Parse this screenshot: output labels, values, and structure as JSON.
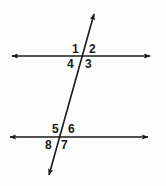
{
  "figure": {
    "name": "parallel-lines-cut-by-transversal",
    "background_color": "#fefefe",
    "stroke_color": "#1a1a1a",
    "label_color": "#1a1a1a",
    "width": 166,
    "height": 186
  },
  "lines": {
    "top_parallel": {
      "name": "top-parallel-line",
      "x1": 12,
      "y1": 56,
      "x2": 150,
      "y2": 56,
      "arrows": "both"
    },
    "bottom_parallel": {
      "name": "bottom-parallel-line",
      "x1": 10,
      "y1": 137,
      "x2": 148,
      "y2": 137,
      "arrows": "both"
    },
    "transversal": {
      "name": "transversal-line",
      "x1": 94,
      "y1": 14,
      "x2": 49,
      "y2": 175,
      "arrows": "both"
    }
  },
  "intersections": {
    "top": {
      "x": 82,
      "y": 56
    },
    "bottom": {
      "x": 59,
      "y": 137
    }
  },
  "angle_labels": [
    {
      "id": "angle-1",
      "text": "1",
      "x": 72,
      "y": 43,
      "position": "top-intersection-upper-left"
    },
    {
      "id": "angle-2",
      "text": "2",
      "x": 89,
      "y": 43,
      "position": "top-intersection-upper-right"
    },
    {
      "id": "angle-3",
      "text": "3",
      "x": 85,
      "y": 58,
      "position": "top-intersection-lower-right"
    },
    {
      "id": "angle-4",
      "text": "4",
      "x": 67,
      "y": 58,
      "position": "top-intersection-lower-left"
    },
    {
      "id": "angle-5",
      "text": "5",
      "x": 52,
      "y": 123,
      "position": "bottom-intersection-upper-left"
    },
    {
      "id": "angle-6",
      "text": "6",
      "x": 68,
      "y": 123,
      "position": "bottom-intersection-upper-right"
    },
    {
      "id": "angle-7",
      "text": "7",
      "x": 61,
      "y": 139,
      "position": "bottom-intersection-lower-right"
    },
    {
      "id": "angle-8",
      "text": "8",
      "x": 45,
      "y": 139,
      "position": "bottom-intersection-lower-left"
    }
  ]
}
